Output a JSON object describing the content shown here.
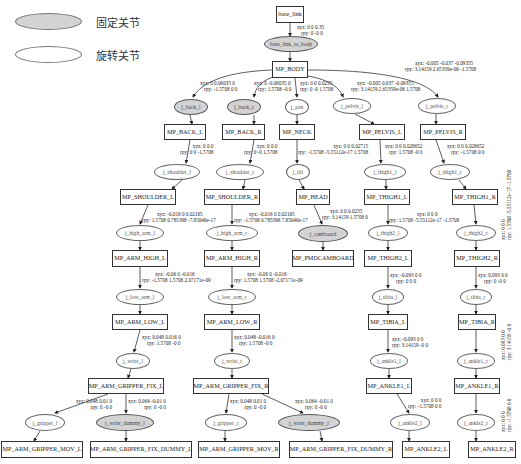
{
  "legend": {
    "fixed": {
      "label": "固定关节",
      "fill": "#d3d3d3"
    },
    "revolute": {
      "label": "旋转关节",
      "fill": "#ffffff"
    }
  },
  "links": {
    "base_link": "base_link",
    "mp_body": "MP_BODY",
    "mp_back_l": "MP_BACK_L",
    "mp_back_r": "MP_BACK_R",
    "mp_neck": "MP_NECK",
    "mp_pelvis_l": "MP_PELVIS_L",
    "mp_pelvis_r": "MP_PELVIS_R",
    "mp_shoulder_l": "MP_SHOULDER_L",
    "mp_shoulder_r": "MP_SHOULDER_R",
    "mp_head": "MP_HEAD",
    "mp_thigh1_l": "MP_THIGH1_L",
    "mp_thigh1_r": "MP_THIGH1_R",
    "mp_arm_high_l": "MP_ARM_HIGH_L",
    "mp_arm_high_r": "MP_ARM_HIGH_R",
    "mp_pmdcamboard": "MP_PMDCAMBOARD",
    "mp_thigh2_l": "MP_THIGH2_L",
    "mp_thigh2_r": "MP_THIGH2_R",
    "mp_arm_low_l": "MP_ARM_LOW_L",
    "mp_arm_low_r": "MP_ARM_LOW_R",
    "mp_tibia_l": "MP_TIBIA_L",
    "mp_tibia_r": "MP_TIBIA_R",
    "mp_arm_gripper_fix_l": "MP_ARM_GRIPPER_FIX_L",
    "mp_arm_gripper_fix_r": "MP_ARM_GRIPPER_FIX_R",
    "mp_ankle1_l": "MP_ANKLE1_L",
    "mp_ankle1_r": "MP_ANKLE1_R",
    "mp_arm_gripper_mov_l": "MP_ARM_GRIPPER_MOV_L",
    "mp_arm_gripper_fix_dummy_l": "MP_ARM_GRIPPER_FIX_DUMMY_L",
    "mp_arm_gripper_mov_r": "MP_ARM_GRIPPER_MOV_R",
    "mp_arm_gripper_fix_dummy_r": "MP_ARM_GRIPPER_FIX_DUMMY_R",
    "mp_ankle2_l": "MP_ANKLE2_L",
    "mp_ankle2_r": "MP_ANKLE2_R"
  },
  "joints": {
    "base_link_to_body": "base_link_to_body",
    "j_back_l": "j_back_l",
    "j_back_r": "j_back_r",
    "j_pan": "j_pan",
    "j_pelvis_l": "j_pelvis_l",
    "j_pelvis_r": "j_pelvis_r",
    "j_shoulder_l": "j_shoulder_l",
    "j_shoulder_r": "j_shoulder_r",
    "j_tilt": "j_tilt",
    "j_thigh1_l": "j_thigh1_l",
    "j_thigh1_r": "j_thigh1_r",
    "j_high_arm_l": "j_high_arm_l",
    "j_high_arm_r": "j_high_arm_r",
    "j_camboard": "j_camboard",
    "j_thigh2_l": "j_thigh2_l",
    "j_thigh2_r": "j_thigh2_r",
    "j_low_arm_l": "j_low_arm_l",
    "j_low_arm_r": "j_low_arm_r",
    "j_tibia_l": "j_tibia_l",
    "j_tibia_r": "j_tibia_r",
    "j_wrist_l": "j_wrist_l",
    "j_wrist_r": "j_wrist_r",
    "j_ankle1_l": "j_ankle1_l",
    "j_ankle1_r": "j_ankle1_r",
    "j_gripper_l": "j_gripper_l",
    "j_wrist_dummy_l": "j_wrist_dummy_l",
    "j_gripper_r": "j_gripper_r",
    "j_wrist_dummy_r": "j_wrist_dummy_r",
    "j_ankle2_l": "j_ankle2_l",
    "j_ankle2_r": "j_ankle2_r"
  },
  "edge_labels": {
    "base_to_body": {
      "xyz": "xyz: 0 0 0.35",
      "rpy": "rpy: 0 -0 0"
    },
    "back_l": {
      "xyz": "xyz: 0 0.06035 0",
      "rpy": "rpy: -1.5708 0 0"
    },
    "back_r": {
      "xyz": "xyz: 0 -0.06035 0",
      "rpy": "rpy: 1.5708 -0 0"
    },
    "pan": {
      "xyz": "xyz: 0 0 0.0235",
      "rpy": "rpy: 0 -0 1.5708"
    },
    "pelvis_l": {
      "xyz": "xyz: -0.005 0.037 -0.09355",
      "rpy": "rpy: 3.14159 2.65359e-06 1.5708"
    },
    "pelvis_r": {
      "xyz": "xyz: -0.005 -0.037 -0.09355",
      "rpy": "rpy: 3.14159 2.65359e-06 -1.5708"
    },
    "shoulder_l": {
      "xyz": "xyz: 0 0 0",
      "rpy": "rpy: 0 0 -1.5708"
    },
    "shoulder_r": {
      "xyz": "xyz: 0 0 0",
      "rpy": "rpy: 0 -0 1.5708"
    },
    "tilt": {
      "xyz": "xyz: 0 0 0.02715",
      "rpy": "rpy: -1.5708 -5.55112e-17 1.5708"
    },
    "thigh1_l": {
      "xyz": "xyz: 0 0 0.028652",
      "rpy": "rpy: 1.5708 -0 0"
    },
    "thigh1_r": {
      "xyz": "xyz: 0 0 0.028652",
      "rpy": "rpy: -1.5708 0 0"
    },
    "high_arm_l": {
      "xyz": "xyz: -0.016 0 0.02165",
      "rpy": "rpy: 1.5708 0.785398 -7.85046e-17"
    },
    "high_arm_r": {
      "xyz": "xyz: -0.016 0 0.02165",
      "rpy": "rpy: -1.5708 0.785398 7.85046e-17"
    },
    "camboard": {
      "xyz": "xyz: 0 0 0.0235",
      "rpy": "rpy: 3.14159 1.5708 0"
    },
    "thigh2_l": {
      "xyz": "xyz: 0 0 0",
      "rpy": "rpy: 1.5708 -5.55112e-17 -1.5708"
    },
    "thigh2_r": {
      "xyz": "xyz: 0 0 0",
      "rpy": "rpy: 1.5708 -5.55112e-17 -1.5708"
    },
    "low_arm_l": {
      "xyz": "xyz: -0.06 0 -0.016",
      "rpy": "rpy: -1.5708 1.5708 2.07171e-09"
    },
    "low_arm_r": {
      "xyz": "xyz: -0.06 0 -0.016",
      "rpy": "rpy: 1.5708 1.5708 -2.07171e-09"
    },
    "tibia_l": {
      "xyz": "xyz: -0.093 0 0",
      "rpy": "rpy: 0 0 0"
    },
    "tibia_r": {
      "xyz": "xyz: 0.093 0 0",
      "rpy": "rpy: 0 -0 0"
    },
    "wrist_l": {
      "xyz": "xyz: 0.048 0.016 0",
      "rpy": "rpy: 1.5708 -0 0"
    },
    "wrist_r": {
      "xyz": "xyz: 0.048 -0.016 0",
      "rpy": "rpy: 1.5708 -0 0"
    },
    "ankle1_l": {
      "xyz": "xyz: -0.093 0 0",
      "rpy": "rpy: 3.14159 -0 0"
    },
    "ankle1_r": {
      "xyz": "xyz: 0.093 0 0",
      "rpy": "rpy: 3.14159 -0 0"
    },
    "gripper_l": {
      "xyz": "xyz: 0.048 0.01 0",
      "rpy": "rpy: 0 -0 0"
    },
    "wrist_dummy_l": {
      "xyz": "xyz: 0.064 -0.01 0",
      "rpy": "rpy: 0 -0 0"
    },
    "gripper_r": {
      "xyz": "xyz: 0.048 0.01 0",
      "rpy": "rpy: 0 -0 0"
    },
    "wrist_dummy_r": {
      "xyz": "xyz: 0.064 -0.01 0",
      "rpy": "rpy: 0 -0 0"
    },
    "ankle2_l": {
      "xyz": "xyz: 0 0 0",
      "rpy": "rpy: -1.5708 0 0"
    },
    "ankle2_r": {
      "xyz": "xyz: 0 0 0",
      "rpy": "rpy: -1.5708 0 0"
    }
  }
}
